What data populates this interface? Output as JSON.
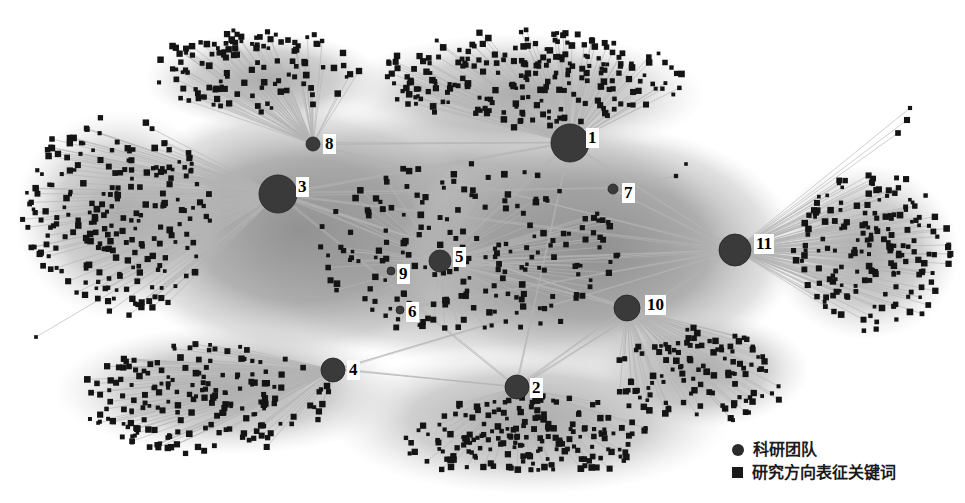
{
  "figure": {
    "width": 965,
    "height": 503,
    "background_color": "#ffffff"
  },
  "legend": {
    "items": [
      {
        "marker": "circle-marker",
        "label": "科研团队",
        "color": "#2b2b2b"
      },
      {
        "marker": "square-marker",
        "label": "研究方向表征关键词",
        "color": "#1a1a1a"
      }
    ]
  },
  "chart_data": {
    "type": "scatter",
    "title": "",
    "xlabel": "",
    "ylabel": "",
    "grid": false,
    "legend_position": "bottom-right",
    "colors": {
      "team_node": "#3a3a3a",
      "keyword_node": "#141414",
      "edge": "#b4b4b4",
      "haze": "#9e9e9e",
      "background": "#ffffff",
      "label_text": "#000000",
      "label_background": "#ffffff"
    },
    "node_types": [
      {
        "name": "科研团队",
        "shape": "circle",
        "count": 11
      },
      {
        "name": "研究方向表征关键词",
        "shape": "square",
        "count": 1600
      }
    ],
    "team_nodes": [
      {
        "id": "1",
        "label": "1",
        "x": 570,
        "y": 143,
        "r": 19,
        "label_x": 586,
        "label_y": 128
      },
      {
        "id": "2",
        "label": "2",
        "x": 517,
        "y": 387,
        "r": 12,
        "label_x": 530,
        "label_y": 378
      },
      {
        "id": "3",
        "label": "3",
        "x": 278,
        "y": 194,
        "r": 19,
        "label_x": 296,
        "label_y": 177
      },
      {
        "id": "4",
        "label": "4",
        "x": 333,
        "y": 370,
        "r": 12,
        "label_x": 347,
        "label_y": 360
      },
      {
        "id": "5",
        "label": "5",
        "x": 440,
        "y": 261,
        "r": 11,
        "label_x": 453,
        "label_y": 247
      },
      {
        "id": "6",
        "label": "6",
        "x": 400,
        "y": 310,
        "r": 4,
        "label_x": 406,
        "label_y": 302
      },
      {
        "id": "7",
        "label": "7",
        "x": 613,
        "y": 189,
        "r": 5,
        "label_x": 622,
        "label_y": 183
      },
      {
        "id": "8",
        "label": "8",
        "x": 313,
        "y": 144,
        "r": 7,
        "label_x": 323,
        "label_y": 134
      },
      {
        "id": "9",
        "label": "9",
        "x": 391,
        "y": 271,
        "r": 4,
        "label_x": 397,
        "label_y": 264
      },
      {
        "id": "10",
        "label": "10",
        "x": 627,
        "y": 308,
        "r": 13,
        "label_x": 645,
        "label_y": 295
      },
      {
        "id": "11",
        "label": "11",
        "x": 735,
        "y": 250,
        "r": 16,
        "label_x": 754,
        "label_y": 234
      }
    ],
    "keyword_clusters": [
      {
        "owner": "3",
        "cx": 118,
        "cy": 215,
        "rx": 95,
        "ry": 100,
        "count": 230
      },
      {
        "owner": "1",
        "cx": 530,
        "cy": 78,
        "rx": 150,
        "ry": 48,
        "count": 230
      },
      {
        "owner": "11",
        "cx": 872,
        "cy": 252,
        "rx": 78,
        "ry": 80,
        "count": 180
      },
      {
        "owner": "4",
        "cx": 205,
        "cy": 398,
        "rx": 130,
        "ry": 55,
        "count": 190
      },
      {
        "owner": "2",
        "cx": 527,
        "cy": 440,
        "rx": 125,
        "ry": 45,
        "count": 200
      },
      {
        "owner": "10",
        "cx": 700,
        "cy": 378,
        "rx": 90,
        "ry": 48,
        "count": 120
      },
      {
        "owner": "8",
        "cx": 255,
        "cy": 70,
        "rx": 105,
        "ry": 40,
        "count": 120
      },
      {
        "owner": "5",
        "cx": 470,
        "cy": 250,
        "rx": 150,
        "ry": 90,
        "count": 200
      }
    ],
    "outlier_keywords": [
      {
        "x": 910,
        "y": 108
      },
      {
        "x": 907,
        "y": 120
      },
      {
        "x": 898,
        "y": 133
      },
      {
        "x": 52,
        "y": 139
      },
      {
        "x": 36,
        "y": 337
      },
      {
        "x": 408,
        "y": 104
      },
      {
        "x": 418,
        "y": 96
      },
      {
        "x": 686,
        "y": 164
      },
      {
        "x": 676,
        "y": 176
      }
    ]
  }
}
